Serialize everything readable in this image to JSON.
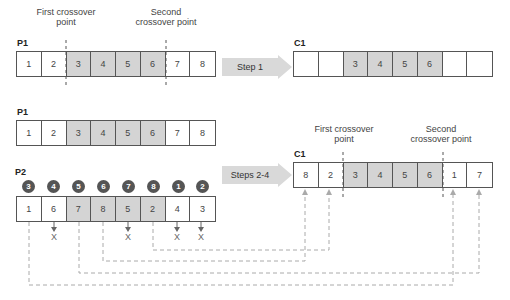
{
  "section1": {
    "first_crossover_label": [
      "First crossover",
      "point"
    ],
    "second_crossover_label": [
      "Second",
      "crossover point"
    ],
    "p1_label": "P1",
    "p1_cells": [
      "1",
      "2",
      "3",
      "4",
      "5",
      "6",
      "7",
      "8"
    ],
    "step_label": "Step 1",
    "c1_label": "C1",
    "c1_cells": [
      "",
      "",
      "3",
      "4",
      "5",
      "6",
      "",
      ""
    ]
  },
  "section2": {
    "p1_label": "P1",
    "p1_cells": [
      "1",
      "2",
      "3",
      "4",
      "5",
      "6",
      "7",
      "8"
    ],
    "p2_label": "P2",
    "p2_order_circles": [
      "3",
      "4",
      "5",
      "6",
      "7",
      "8",
      "1",
      "2"
    ],
    "p2_cells": [
      "1",
      "6",
      "7",
      "8",
      "5",
      "2",
      "4",
      "3"
    ],
    "rejected_mark": "X",
    "step_label": "Steps 2-4",
    "first_crossover_label": [
      "First crossover",
      "point"
    ],
    "second_crossover_label": [
      "Second",
      "crossover point"
    ],
    "c1_label": "C1",
    "c1_cells": [
      "8",
      "2",
      "3",
      "4",
      "5",
      "6",
      "1",
      "7"
    ]
  },
  "colors": {
    "shaded_cell": "#d4d4d4",
    "circle": "#555555",
    "arrow": "#d9d9d9",
    "dashed_line": "#aaaaaa"
  }
}
